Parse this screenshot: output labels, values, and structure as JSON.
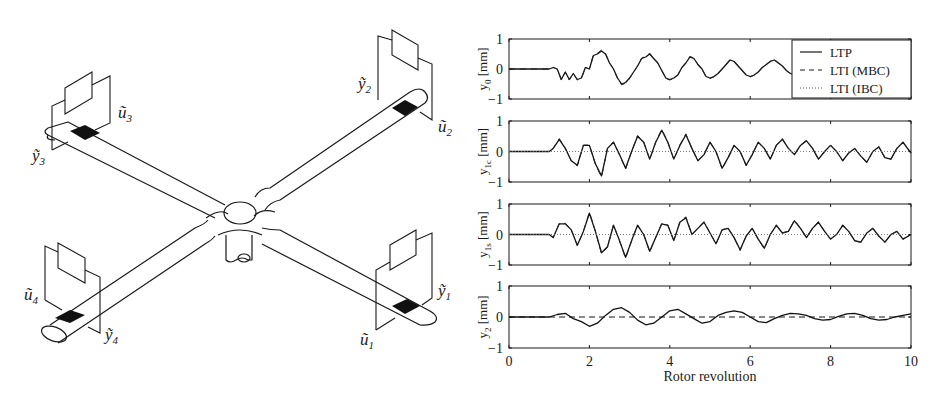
{
  "diagram": {
    "labels": {
      "u1": "ũ",
      "u1_sub": "1",
      "u2": "ũ",
      "u2_sub": "2",
      "u3": "ũ",
      "u3_sub": "3",
      "u4": "ũ",
      "u4_sub": "4",
      "y1": "ỹ",
      "y1_sub": "1",
      "y2": "ỹ",
      "y2_sub": "2",
      "y3": "ỹ",
      "y3_sub": "3",
      "y4": "ỹ",
      "y4_sub": "4"
    }
  },
  "chart_data": [
    {
      "type": "line",
      "panel": "y0",
      "ylabel": "y_0 [mm]",
      "ylabel_main": "y",
      "ylabel_sub": "0",
      "ylabel_unit": "[mm]",
      "ylim": [
        -1,
        1
      ],
      "yticks": [
        "1",
        "0",
        "-1"
      ],
      "xlim": [
        0,
        10
      ],
      "legend": {
        "position": "upper right",
        "entries": [
          "LTP",
          "LTI (MBC)",
          "LTI (IBC)"
        ]
      },
      "x": [
        0,
        1.0,
        1.1,
        1.2,
        1.3,
        1.4,
        1.5,
        1.6,
        1.7,
        1.8,
        1.9,
        2.0,
        2.1,
        2.2,
        2.3,
        2.4,
        2.5,
        2.6,
        2.7,
        2.8,
        2.9,
        3.0,
        3.1,
        3.2,
        3.3,
        3.4,
        3.5,
        3.6,
        3.7,
        3.8,
        3.9,
        4.0,
        4.1,
        4.2,
        4.3,
        4.4,
        4.5,
        4.6,
        4.7,
        4.8,
        4.9,
        5.0,
        5.1,
        5.2,
        5.3,
        5.4,
        5.5,
        5.6,
        5.7,
        5.8,
        5.9,
        6.0,
        6.1,
        6.2,
        6.3,
        6.4,
        6.5,
        6.6,
        6.7,
        6.8,
        6.9,
        7.0,
        7.1,
        7.2,
        7.3,
        7.4,
        7.5,
        7.6,
        7.7,
        7.8,
        7.9,
        8.0,
        8.1,
        8.2,
        8.3,
        8.4,
        8.5,
        8.6,
        8.7,
        8.8,
        8.9,
        9.0,
        9.1,
        9.2,
        9.3,
        9.4,
        9.5,
        9.6,
        9.7,
        9.8,
        9.9,
        10.0
      ],
      "series": [
        {
          "name": "LTP",
          "values": [
            0,
            0,
            0.05,
            0.0,
            -0.35,
            -0.1,
            -0.35,
            -0.15,
            -0.35,
            -0.3,
            0.05,
            0.0,
            0.45,
            0.5,
            0.6,
            0.5,
            0.2,
            0.0,
            -0.3,
            -0.5,
            -0.45,
            -0.3,
            -0.1,
            0.1,
            0.35,
            0.4,
            0.5,
            0.35,
            0.2,
            -0.05,
            -0.3,
            -0.35,
            -0.3,
            -0.2,
            0.05,
            0.2,
            0.4,
            0.35,
            0.15,
            0.0,
            -0.25,
            -0.3,
            -0.25,
            -0.15,
            0.0,
            0.15,
            0.3,
            0.25,
            0.1,
            -0.05,
            -0.2,
            -0.25,
            -0.2,
            -0.1,
            0.05,
            0.15,
            0.25,
            0.3,
            0.2,
            0.1,
            -0.05,
            -0.15,
            -0.2,
            -0.15,
            -0.05,
            0.05,
            0.15,
            0.2,
            0.15,
            0.05,
            -0.05,
            -0.1,
            -0.12,
            -0.05,
            0.05,
            0.1,
            0.15,
            0.1,
            0.05,
            -0.02,
            -0.08,
            -0.1,
            -0.05,
            0.02,
            0.08,
            0.1,
            0.08,
            0.05,
            0.0,
            0.02,
            0.05,
            0.02
          ]
        }
      ]
    },
    {
      "type": "line",
      "panel": "y1c",
      "ylabel": "y_1c [mm]",
      "ylabel_main": "y",
      "ylabel_sub": "1c",
      "ylabel_unit": "[mm]",
      "ylim": [
        -1,
        1
      ],
      "yticks": [
        "1",
        "0",
        "-1"
      ],
      "xlim": [
        0,
        10
      ],
      "x": [
        0,
        1.0,
        1.1,
        1.25,
        1.4,
        1.55,
        1.7,
        1.85,
        2.0,
        2.15,
        2.3,
        2.45,
        2.6,
        2.75,
        2.9,
        3.05,
        3.2,
        3.35,
        3.5,
        3.65,
        3.8,
        3.95,
        4.1,
        4.25,
        4.4,
        4.55,
        4.7,
        4.85,
        5.0,
        5.15,
        5.3,
        5.45,
        5.6,
        5.75,
        5.9,
        6.05,
        6.2,
        6.35,
        6.5,
        6.65,
        6.8,
        6.95,
        7.1,
        7.25,
        7.4,
        7.55,
        7.7,
        7.85,
        8.0,
        8.15,
        8.3,
        8.45,
        8.6,
        8.75,
        8.9,
        9.05,
        9.2,
        9.35,
        9.5,
        9.65,
        9.8,
        10.0
      ],
      "series": [
        {
          "name": "LTP",
          "values": [
            0,
            0,
            0.1,
            0.4,
            0.1,
            -0.3,
            -0.45,
            0.2,
            0.2,
            -0.4,
            -0.8,
            0.1,
            0.3,
            -0.1,
            -0.55,
            0.0,
            0.5,
            0.3,
            -0.25,
            0.3,
            0.7,
            0.3,
            -0.25,
            0.2,
            0.55,
            0.1,
            -0.3,
            -0.1,
            0.3,
            0.0,
            -0.55,
            -0.2,
            0.2,
            0.0,
            -0.45,
            -0.1,
            0.3,
            0.1,
            -0.25,
            0.2,
            0.4,
            0.1,
            -0.1,
            0.2,
            0.35,
            0.1,
            -0.25,
            0.0,
            0.2,
            0.0,
            -0.3,
            -0.05,
            0.1,
            -0.15,
            -0.35,
            0.0,
            0.15,
            -0.2,
            -0.25,
            0.1,
            0.3,
            -0.05
          ]
        },
        {
          "name": "LTI (IBC)",
          "values": [
            0,
            0,
            0,
            0,
            0,
            0,
            0,
            0,
            0,
            0,
            0,
            0,
            0,
            0,
            0,
            0,
            0,
            0,
            0,
            0,
            0,
            0,
            0,
            0,
            0,
            0,
            0,
            0,
            0,
            0,
            0,
            0,
            0,
            0,
            0,
            0,
            0,
            0,
            0,
            0,
            0,
            0,
            0,
            0,
            0,
            0,
            0,
            0,
            0,
            0,
            0,
            0,
            0,
            0,
            0,
            0,
            0,
            0,
            0,
            0,
            0,
            0
          ]
        }
      ]
    },
    {
      "type": "line",
      "panel": "y1s",
      "ylabel": "y_1s [mm]",
      "ylabel_main": "y",
      "ylabel_sub": "1s",
      "ylabel_unit": "[mm]",
      "ylim": [
        -1,
        1
      ],
      "yticks": [
        "1",
        "0",
        "-1"
      ],
      "xlim": [
        0,
        10
      ],
      "x": [
        0,
        1.0,
        1.1,
        1.25,
        1.4,
        1.55,
        1.7,
        1.85,
        2.0,
        2.15,
        2.3,
        2.45,
        2.6,
        2.75,
        2.9,
        3.05,
        3.2,
        3.35,
        3.5,
        3.65,
        3.8,
        3.95,
        4.1,
        4.25,
        4.4,
        4.55,
        4.7,
        4.85,
        5.0,
        5.15,
        5.3,
        5.45,
        5.6,
        5.75,
        5.9,
        6.05,
        6.2,
        6.35,
        6.5,
        6.65,
        6.8,
        6.95,
        7.1,
        7.25,
        7.4,
        7.55,
        7.7,
        7.85,
        8.0,
        8.15,
        8.3,
        8.45,
        8.6,
        8.75,
        8.9,
        9.05,
        9.2,
        9.35,
        9.5,
        9.65,
        9.8,
        10.0
      ],
      "series": [
        {
          "name": "LTP",
          "values": [
            0,
            0,
            -0.1,
            0.35,
            0.35,
            0.15,
            -0.35,
            0.1,
            0.7,
            0.1,
            -0.6,
            -0.4,
            0.3,
            -0.2,
            -0.75,
            -0.2,
            0.3,
            0.0,
            -0.55,
            -0.1,
            0.35,
            0.3,
            -0.2,
            0.4,
            0.55,
            0.0,
            0.2,
            0.4,
            0.05,
            -0.3,
            0.15,
            0.2,
            -0.1,
            -0.5,
            -0.05,
            0.2,
            -0.15,
            -0.45,
            0.0,
            0.3,
            0.05,
            0.1,
            0.45,
            0.2,
            -0.1,
            0.2,
            0.4,
            0.1,
            -0.15,
            0.0,
            0.3,
            0.1,
            -0.2,
            -0.25,
            0.05,
            0.2,
            -0.05,
            -0.25,
            0.0,
            0.1,
            -0.15,
            0.0
          ]
        },
        {
          "name": "LTI (IBC)",
          "values": [
            0,
            0,
            0,
            0,
            0,
            0,
            0,
            0,
            0,
            0,
            0,
            0,
            0,
            0,
            0,
            0,
            0,
            0,
            0,
            0,
            0,
            0,
            0,
            0,
            0,
            0,
            0,
            0,
            0,
            0,
            0,
            0,
            0,
            0,
            0,
            0,
            0,
            0,
            0,
            0,
            0,
            0,
            0,
            0,
            0,
            0,
            0,
            0,
            0,
            0,
            0,
            0,
            0,
            0,
            0,
            0,
            0,
            0,
            0,
            0,
            0,
            0
          ]
        }
      ]
    },
    {
      "type": "line",
      "panel": "y2",
      "ylabel": "y_2 [mm]",
      "ylabel_main": "y",
      "ylabel_sub": "2",
      "ylabel_unit": "[mm]",
      "ylim": [
        -1,
        1
      ],
      "yticks": [
        "1",
        "0",
        "-1"
      ],
      "xlim": [
        0,
        10
      ],
      "xticks": [
        "0",
        "2",
        "4",
        "6",
        "8",
        "10"
      ],
      "xlabel": "Rotor revolution",
      "x": [
        0,
        1.0,
        1.2,
        1.4,
        1.6,
        1.8,
        2.0,
        2.2,
        2.4,
        2.6,
        2.8,
        3.0,
        3.2,
        3.4,
        3.6,
        3.8,
        4.0,
        4.2,
        4.4,
        4.6,
        4.8,
        5.0,
        5.2,
        5.4,
        5.6,
        5.8,
        6.0,
        6.2,
        6.4,
        6.6,
        6.8,
        7.0,
        7.2,
        7.4,
        7.6,
        7.8,
        8.0,
        8.2,
        8.4,
        8.6,
        8.8,
        9.0,
        9.2,
        9.4,
        9.6,
        9.8,
        10.0
      ],
      "series": [
        {
          "name": "LTP",
          "values": [
            0,
            0,
            0.08,
            0.12,
            -0.05,
            -0.15,
            -0.3,
            -0.2,
            0.05,
            0.25,
            0.3,
            0.15,
            -0.1,
            -0.25,
            -0.2,
            0.0,
            0.2,
            0.25,
            0.1,
            -0.05,
            -0.2,
            -0.15,
            0.05,
            0.15,
            0.2,
            0.15,
            0.0,
            -0.15,
            -0.18,
            -0.05,
            0.05,
            0.12,
            0.1,
            0.05,
            -0.05,
            -0.1,
            -0.08,
            0.02,
            0.1,
            0.12,
            0.05,
            -0.05,
            -0.1,
            -0.08,
            0.0,
            0.05,
            0.1
          ]
        },
        {
          "name": "LTI (MBC)",
          "values": [
            0,
            0,
            0,
            0,
            0,
            0,
            0,
            0,
            0,
            0,
            0,
            0,
            0,
            0,
            0,
            0,
            0,
            0,
            0,
            0,
            0,
            0,
            0,
            0,
            0,
            0,
            0,
            0,
            0,
            0,
            0,
            0,
            0,
            0,
            0,
            0,
            0,
            0,
            0,
            0,
            0,
            0,
            0,
            0,
            0,
            0,
            0
          ]
        }
      ]
    }
  ]
}
